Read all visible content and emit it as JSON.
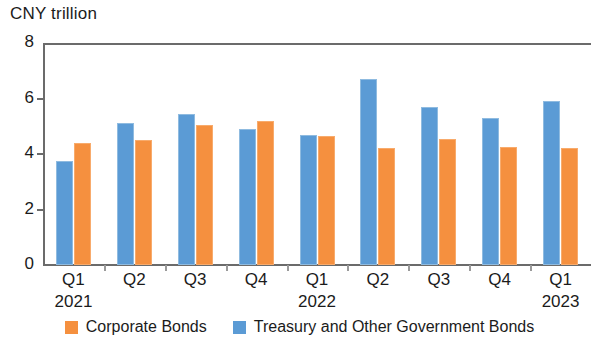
{
  "chart_data": {
    "type": "bar",
    "title": "",
    "ylabel": "CNY trillion",
    "xlabel": "",
    "ylim": [
      0,
      8
    ],
    "yticks": [
      0,
      2,
      4,
      6,
      8
    ],
    "ytick_labels": [
      "0",
      "2",
      "4",
      "6",
      "8"
    ],
    "grid": false,
    "legend_position": "bottom",
    "categories": [
      "Q1",
      "Q2",
      "Q3",
      "Q4",
      "Q1",
      "Q2",
      "Q3",
      "Q4",
      "Q1"
    ],
    "group_labels": [
      {
        "label": "2021",
        "index": 0
      },
      {
        "label": "2022",
        "index": 4
      },
      {
        "label": "2023",
        "index": 8
      }
    ],
    "series": [
      {
        "name": "Treasury and Other Government Bonds",
        "color": "#5b9bd5",
        "values": [
          3.75,
          5.1,
          5.45,
          4.9,
          4.7,
          6.7,
          5.7,
          5.3,
          5.9
        ]
      },
      {
        "name": "Corporate Bonds",
        "color": "#f5903f",
        "values": [
          4.4,
          4.5,
          5.05,
          5.2,
          4.65,
          4.2,
          4.55,
          4.25,
          4.2
        ]
      }
    ],
    "legend": [
      {
        "label": "Corporate Bonds",
        "color": "#f5903f",
        "swatch": "orange"
      },
      {
        "label": "Treasury and Other Government Bonds",
        "color": "#5b9bd5",
        "swatch": "blue"
      }
    ]
  }
}
